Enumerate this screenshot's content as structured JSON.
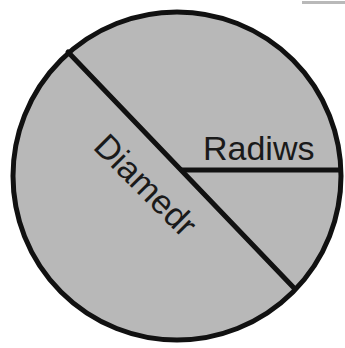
{
  "figure": {
    "background_color": "#ffffff",
    "circle": {
      "name": "circle",
      "fill_color": "#b8b8b8",
      "stroke_color": "#111111",
      "stroke_width": 5,
      "center_x": 177,
      "center_y": 176,
      "radius": 164
    },
    "diameter_line": {
      "name": "diameter",
      "stroke_color": "#111111",
      "stroke_width": 5,
      "x1": 68,
      "y1": 52,
      "x2": 294,
      "y2": 288
    },
    "radius_line": {
      "name": "radius",
      "stroke_color": "#111111",
      "stroke_width": 5,
      "x1": 181,
      "y1": 170,
      "x2": 340,
      "y2": 170
    },
    "labels": {
      "diameter": {
        "text": "Diamedr",
        "x": 92,
        "y": 148,
        "rotation": 45,
        "font_size": 34,
        "color": "#1a1a1a"
      },
      "radius": {
        "text": "Radiws",
        "x": 203,
        "y": 160,
        "rotation": 0,
        "font_size": 34,
        "color": "#1a1a1a"
      }
    },
    "scan_artifact": {
      "name": "scan-edge-artifact",
      "color": "#b9b9b9",
      "x": 302,
      "y": 1,
      "width": 43,
      "height": 3
    }
  }
}
